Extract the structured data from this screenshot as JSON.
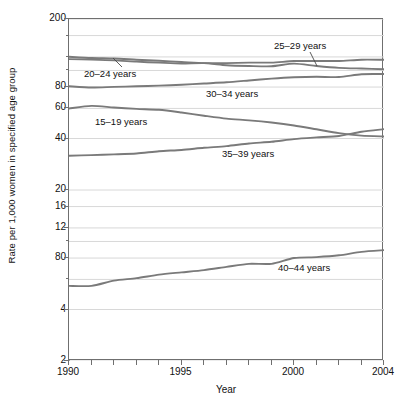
{
  "chart_data": {
    "type": "line",
    "title": "",
    "subtitle": "",
    "xlabel": "Year",
    "ylabel": "Rate per 1,000 women in specified age group",
    "yscale": "log",
    "grid": "horizontal",
    "legend_position": "inline-annotations",
    "xlim": [
      1990,
      2004
    ],
    "ylim": [
      2,
      200
    ],
    "x_tick_labels": [
      "1990",
      "1995",
      "2000",
      "2004"
    ],
    "x_tick_values": [
      1990,
      1995,
      2000,
      2004
    ],
    "x_minor_ticks": [
      1990,
      1991,
      1992,
      1993,
      1994,
      1995,
      1996,
      1997,
      1998,
      1999,
      2000,
      2001,
      2002,
      2003,
      2004
    ],
    "y_tick_labels": [
      "200",
      "80",
      "60",
      "40",
      "20",
      "16",
      "12",
      "80",
      "4",
      "2"
    ],
    "y_tick_values": [
      200,
      80,
      60,
      40,
      20,
      16,
      12,
      8,
      4,
      2
    ],
    "y_gridline_values": [
      200,
      160,
      120,
      100,
      80,
      60,
      40,
      20,
      16,
      12,
      10,
      8,
      6,
      4,
      2
    ],
    "x": [
      1990,
      1991,
      1992,
      1993,
      1994,
      1995,
      1996,
      1997,
      1998,
      1999,
      2000,
      2001,
      2002,
      2003,
      2004
    ],
    "series": [
      {
        "name": "25-29 years",
        "label": "25–29 years",
        "color": "#7a7a7a",
        "values": [
          120.2,
          118.2,
          117.4,
          115.6,
          113.9,
          112.2,
          110.4,
          110.4,
          111.2,
          111.2,
          113.5,
          113.6,
          113.6,
          115.6,
          115.5
        ]
      },
      {
        "name": "20-24 years",
        "label": "20–24 years",
        "color": "#7a7a7a",
        "values": [
          116.5,
          115.7,
          114.6,
          112.6,
          111.1,
          109.8,
          110.4,
          107.3,
          106.2,
          105.8,
          109.7,
          106.2,
          103.6,
          102.6,
          101.7
        ]
      },
      {
        "name": "30-34 years",
        "label": "30–34 years",
        "color": "#7a7a7a",
        "values": [
          80.8,
          79.5,
          80.2,
          80.8,
          81.5,
          82.5,
          83.9,
          85.3,
          87.4,
          89.6,
          91.2,
          91.9,
          91.5,
          95.1,
          95.3
        ]
      },
      {
        "name": "15-19 years",
        "label": "15–19 years",
        "color": "#7a7a7a",
        "values": [
          59.9,
          62.1,
          60.7,
          59.6,
          58.9,
          56.8,
          54.4,
          52.3,
          51.1,
          49.6,
          47.7,
          45.3,
          43.0,
          41.6,
          41.1
        ]
      },
      {
        "name": "35-39 years",
        "label": "35–39 years",
        "color": "#7a7a7a",
        "values": [
          31.7,
          32.0,
          32.3,
          32.7,
          33.7,
          34.3,
          35.3,
          36.1,
          37.4,
          38.3,
          39.7,
          40.6,
          41.4,
          43.8,
          45.4
        ]
      },
      {
        "name": "40-44 years",
        "label": "40–44 years",
        "color": "#7a7a7a",
        "values": [
          5.5,
          5.5,
          5.9,
          6.1,
          6.4,
          6.6,
          6.8,
          7.1,
          7.4,
          7.4,
          8.0,
          8.1,
          8.3,
          8.7,
          8.9
        ]
      }
    ],
    "annotations": [
      {
        "text": "25–29 years",
        "series": "25-29 years",
        "leader": true
      },
      {
        "text": "20–24 years",
        "series": "20-24 years",
        "leader": true
      },
      {
        "text": "30–34 years",
        "series": "30-34 years",
        "leader": false
      },
      {
        "text": "15–19 years",
        "series": "15-19 years",
        "leader": false
      },
      {
        "text": "35–39 years",
        "series": "35-39 years",
        "leader": false
      },
      {
        "text": "40–44 years",
        "series": "40-44 years",
        "leader": false
      }
    ]
  },
  "axes": {
    "y_title": "Rate per 1,000 women in specified age group",
    "x_title": "Year"
  },
  "style": {
    "grid_color": "#d8d8d8",
    "frame_color": "#6f6f6f",
    "line_color": "#7a7a7a",
    "text_color": "#111111",
    "background": "#ffffff"
  }
}
